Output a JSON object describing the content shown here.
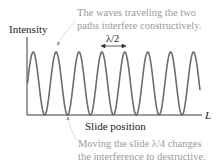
{
  "figure": {
    "ylabel": "Intensity",
    "xlabel": "Slide position",
    "x_end_label": "L",
    "wavelength_label": "λ/2",
    "annotation_top": [
      "The waves traveling the two",
      "paths interfere constructively."
    ],
    "annotation_bottom": [
      "Moving the slide λ/4 changes",
      "the interference to destructive."
    ],
    "colors": {
      "curve": "#6d6d6d",
      "axis": "#3a3a3a",
      "annotation_text": "#9a9a9a",
      "label_text": "#222222"
    }
  },
  "chart_data": {
    "type": "line",
    "title": "",
    "xlabel": "Slide position",
    "ylabel": "Intensity",
    "x_end_label": "L",
    "period_label": "λ/2",
    "peaks_count": 8,
    "troughs_count": 7,
    "annotations": [
      "The waves traveling the two paths interfere constructively.",
      "Moving the slide λ/4 changes the interference to destructive."
    ]
  }
}
